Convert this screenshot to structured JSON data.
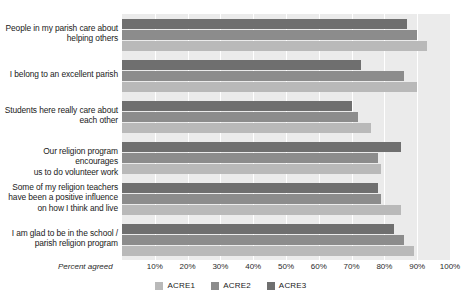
{
  "title": {
    "clipped_text": ""
  },
  "axis": {
    "x_label": "Percent agreed",
    "ticks": [
      "10%",
      "20%",
      "30%",
      "40%",
      "50%",
      "60%",
      "70%",
      "80%",
      "90%",
      "100%"
    ]
  },
  "legend": {
    "items": [
      {
        "label": "ACRE1",
        "color": "#b9b9b9"
      },
      {
        "label": "ACRE2",
        "color": "#8c8c8c"
      },
      {
        "label": "ACRE3",
        "color": "#6f6f6f"
      }
    ]
  },
  "colors": {
    "plot_background": "#ebebeb",
    "gridline": "#ffffff",
    "acre1": "#b9b9b9",
    "acre2": "#8c8c8c",
    "acre3": "#6f6f6f",
    "text": "#1a1a1a"
  },
  "chart_data": {
    "type": "bar",
    "orientation": "horizontal",
    "title": "",
    "xlabel": "Percent agreed",
    "ylabel": "",
    "xlim": [
      0,
      100
    ],
    "xticks": [
      10,
      20,
      30,
      40,
      50,
      60,
      70,
      80,
      90,
      100
    ],
    "grid": true,
    "legend_position": "bottom",
    "categories": [
      "People in my parish care about helping others",
      "I belong to an excellent parish",
      "Students here really care about each other",
      "Our religion program encourages us to do volunteer work",
      "Some of my religion teachers have been a positive influence on how I think and live",
      "I am glad to be in the school / parish religion program"
    ],
    "category_lines": [
      [
        "People in my parish care about",
        "helping others"
      ],
      [
        "I belong to an excellent parish"
      ],
      [
        "Students here really care about",
        "each other"
      ],
      [
        "Our religion program encourages",
        "us to do volunteer work"
      ],
      [
        "Some of my religion teachers",
        "have been a positive influence",
        "on how I think and live"
      ],
      [
        "I am glad to be in the school /",
        "parish religion program"
      ]
    ],
    "series": [
      {
        "name": "ACRE1",
        "color": "#b9b9b9",
        "values": [
          93,
          90,
          76,
          79,
          85,
          89
        ]
      },
      {
        "name": "ACRE2",
        "color": "#8c8c8c",
        "values": [
          90,
          86,
          72,
          78,
          79,
          86
        ]
      },
      {
        "name": "ACRE3",
        "color": "#6f6f6f",
        "values": [
          87,
          73,
          70,
          85,
          78,
          83
        ]
      }
    ]
  }
}
